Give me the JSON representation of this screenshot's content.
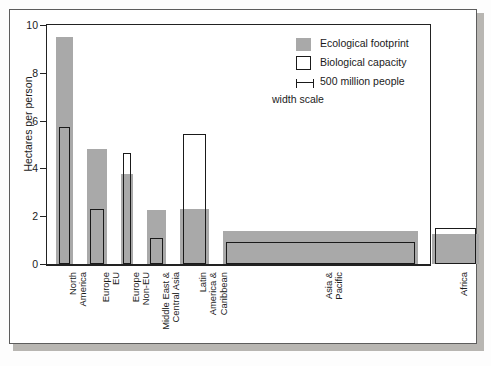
{
  "chart_data": {
    "type": "bar",
    "title": "",
    "xlabel": "",
    "ylabel": "Hectares per person",
    "ylim": [
      0,
      10
    ],
    "yticks": [
      "0",
      "2",
      "4",
      "6",
      "8",
      "10"
    ],
    "grid": false,
    "legend_position": "top-right",
    "note": "Bar widths are proportional to population (500 million people width scale)",
    "categories": [
      "North America",
      "Europe EU",
      "Europe Non-EU",
      "Middle East & Central Asia",
      "Latin America & Caribbean",
      "Asia & Pacific",
      "Africa"
    ],
    "series": [
      {
        "name": "Ecological footprint",
        "values": [
          9.5,
          4.8,
          3.75,
          2.25,
          2.3,
          1.4,
          1.25
        ]
      },
      {
        "name": "Biological capacity",
        "values": [
          5.73,
          2.3,
          4.65,
          1.1,
          5.45,
          0.9,
          1.5
        ]
      }
    ],
    "population_widths": [
      0.32,
      0.39,
      0.24,
      0.36,
      0.55,
      3.75,
      0.9
    ],
    "colors": {
      "footprint_fill": "#a9a9a9",
      "capacity_stroke": "#1a1a1a",
      "axis": "#222222",
      "background": "#ffffff"
    }
  },
  "legend": {
    "items": [
      {
        "label": "Ecological footprint",
        "swatch": "filled-gray-square"
      },
      {
        "label": "Biological capacity",
        "swatch": "open-square"
      },
      {
        "label": "500 million people",
        "swatch": "scale-bar-icon"
      }
    ],
    "sublabel": "width scale"
  }
}
